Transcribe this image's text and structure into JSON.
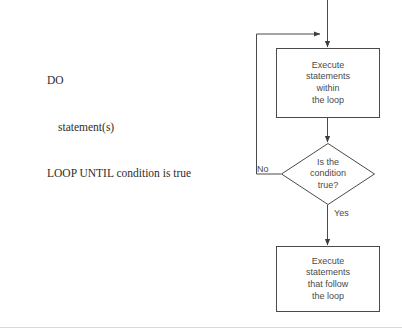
{
  "diagram": {
    "stroke_color": "#4a4a4a",
    "text_color": "#4a4a4a",
    "rule_color": "#d9d9d9",
    "background": "#ffffff"
  },
  "pseudocode": {
    "line1": "DO",
    "line2": "statement(s)",
    "line3": "LOOP UNTIL condition is true"
  },
  "nodes": {
    "execute_within": {
      "line1": "Execute",
      "line2": "statements",
      "line3": "within",
      "line4": "the loop"
    },
    "decision": {
      "line1": "Is the",
      "line2": "condition",
      "line3": "true?"
    },
    "execute_follow": {
      "line1": "Execute",
      "line2": "statements",
      "line3": "that follow",
      "line4": "the loop"
    }
  },
  "labels": {
    "no": "No",
    "yes": "Yes"
  }
}
